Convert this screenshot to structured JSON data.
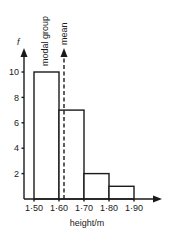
{
  "chart_data": {
    "type": "bar",
    "subtype": "histogram",
    "title": "",
    "xlabel": "height/m",
    "ylabel": "f",
    "bins": [
      {
        "from": 1.5,
        "to": 1.6,
        "value": 10
      },
      {
        "from": 1.6,
        "to": 1.7,
        "value": 7
      },
      {
        "from": 1.7,
        "to": 1.8,
        "value": 2
      },
      {
        "from": 1.8,
        "to": 1.9,
        "value": 1
      }
    ],
    "categories": [
      "1·50–1·60",
      "1·60–1·70",
      "1·70–1·80",
      "1·80–1·90"
    ],
    "values": [
      10,
      7,
      2,
      1
    ],
    "x_ticks": [
      "1·50",
      "1·60",
      "1·70",
      "1·80",
      "1·90"
    ],
    "y_ticks": [
      "2",
      "4",
      "6",
      "8",
      "10"
    ],
    "ylim": [
      0,
      11
    ],
    "xlim": [
      1.46,
      1.97
    ],
    "grid": false,
    "legend": null,
    "annotations": [
      {
        "text": "modal group",
        "position": "vertical arrow above 1·50–1·60 bar"
      },
      {
        "text": "mean",
        "position": "dashed vertical arrow at approx 1·62"
      }
    ],
    "mean_x": 1.62
  },
  "labels": {
    "y_axis": "f",
    "x_axis": "height/m",
    "modal": "modal group",
    "mean": "mean"
  }
}
